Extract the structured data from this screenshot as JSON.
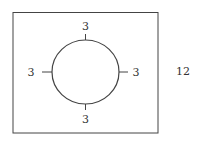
{
  "diagram": {
    "rectangle": {
      "side_label": "12"
    },
    "circle": {
      "gap_labels": {
        "top": "3",
        "bottom": "3",
        "left": "3",
        "right": "3"
      }
    },
    "colors": {
      "stroke": "#444444",
      "text": "#333333",
      "background": "#ffffff"
    }
  }
}
